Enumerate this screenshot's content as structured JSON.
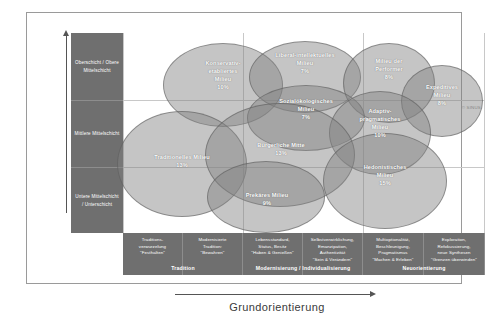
{
  "axes": {
    "y_title": "Soziale Lage",
    "x_title": "Grundorientierung"
  },
  "copyright": "© SINUS",
  "social_bands": [
    {
      "id": "oberschicht",
      "label": "Oberschicht / Obere Mittelschicht"
    },
    {
      "id": "mittlere",
      "label": "Mittlere Mittelschicht"
    },
    {
      "id": "untere",
      "label": "Untere Mittelschicht / Unterschicht"
    }
  ],
  "orientation_cells": [
    {
      "id": "traditionsverwurzelung",
      "desc": "Traditions-\nverwurzelung\n\"Festhalten\""
    },
    {
      "id": "modernisierte-tradition",
      "desc": "Modernisierte\nTradition:\n\"Bewahren\""
    },
    {
      "id": "lebensstandard",
      "desc": "Lebensstandard,\nStatus, Besitz\n\"Haben & Genießen\""
    },
    {
      "id": "selbstverwirklichung",
      "desc": "Selbstverwirklichung,\nEmanzipation, Authentizität\n\"Sein & Verändern\""
    },
    {
      "id": "multioptionalitaet",
      "desc": "Multioptionalität,\nBeschleunigung,\nPragmatismus\n\"Machen & Erleben\""
    },
    {
      "id": "exploration",
      "desc": "Exploration,\nRefokussierung,\nneue Synthesen\n\"Grenzen überwinden\""
    }
  ],
  "orientation_groups": [
    {
      "id": "tradition",
      "label": "Tradition"
    },
    {
      "id": "modernisierung",
      "label": "Modernisierung / Individualisierung"
    },
    {
      "id": "neuorientierung",
      "label": "Neuorientierung"
    }
  ],
  "chart_data": {
    "type": "scatter",
    "title": "",
    "xlabel": "Grundorientierung",
    "ylabel": "Soziale Lage",
    "legend": "none",
    "grid": true,
    "x_categories": [
      "Traditionsverwurzelung \"Festhalten\"",
      "Modernisierte Tradition: \"Bewahren\"",
      "Lebensstandard, Status, Besitz \"Haben & Genießen\"",
      "Selbstverwirklichung, Emanzipation, Authentizität \"Sein & Verändern\"",
      "Multioptionalität, Beschleunigung, Pragmatismus \"Machen & Erleben\"",
      "Exploration, Refokussierung, neue Synthesen \"Grenzen überwinden\""
    ],
    "y_categories": [
      "Oberschicht / Obere Mittelschicht",
      "Mittlere Mittelschicht",
      "Untere Mittelschicht / Unterschicht"
    ],
    "bubbles": [
      {
        "id": "konservativ-etabliert",
        "name": "Konservativ-\netabliertes\nMilieu",
        "value": 10,
        "value_label": "10%",
        "x": 0.3,
        "y": 0.82
      },
      {
        "id": "liberal-intellektuell",
        "name": "Liberal-intellektuelles\nMilieu",
        "value": 7,
        "value_label": "7%",
        "x": 0.52,
        "y": 0.87
      },
      {
        "id": "performer",
        "name": "Milieu der\nPerformer",
        "value": 8,
        "value_label": "8%",
        "x": 0.72,
        "y": 0.85
      },
      {
        "id": "expeditiv",
        "name": "Expeditives\nMilieu",
        "value": 8,
        "value_label": "8%",
        "x": 0.88,
        "y": 0.76
      },
      {
        "id": "sozialoekologisch",
        "name": "Sozialökologisches\nMilieu",
        "value": 7,
        "value_label": "7%",
        "x": 0.5,
        "y": 0.66
      },
      {
        "id": "adaptiv-pragmatisch",
        "name": "Adaptiv-\npragmatisches\nMilieu",
        "value": 10,
        "value_label": "10%",
        "x": 0.72,
        "y": 0.58
      },
      {
        "id": "buergerliche-mitte",
        "name": "Bürgerliche Mitte",
        "value": 13,
        "value_label": "13%",
        "x": 0.46,
        "y": 0.43
      },
      {
        "id": "traditionell",
        "name": "Traditionelles Milieu",
        "value": 13,
        "value_label": "13%",
        "x": 0.2,
        "y": 0.37
      },
      {
        "id": "hedonistisch",
        "name": "Hedonistisches\nMilieu",
        "value": 15,
        "value_label": "15%",
        "x": 0.75,
        "y": 0.3
      },
      {
        "id": "prekaer",
        "name": "Prekäres Milieu",
        "value": 9,
        "value_label": "9%",
        "x": 0.42,
        "y": 0.16
      }
    ]
  }
}
